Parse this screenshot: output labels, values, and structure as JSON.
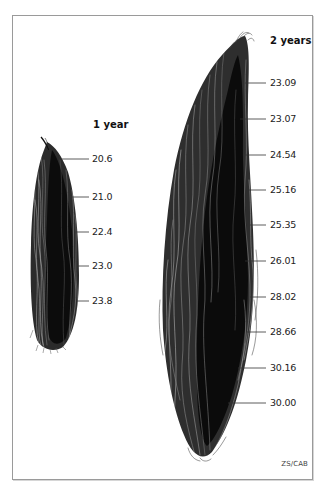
{
  "figure": {
    "credit": "ZS/CAB",
    "colors": {
      "fiber_dark": "#111111",
      "fiber_mid": "#3a3a3a",
      "fiber_light": "#8a8a8a",
      "leader_line": "#333333",
      "frame_border": "#9a9a9a",
      "background": "#ffffff"
    }
  },
  "samples": [
    {
      "id": "one-year",
      "label": "1 year",
      "label_pos": {
        "x": 93,
        "y": 125
      },
      "measurements": [
        {
          "value": "20.6",
          "y": 159,
          "line_x1": 62,
          "line_x2": 89
        },
        {
          "value": "21.0",
          "y": 197,
          "line_x1": 70,
          "line_x2": 89
        },
        {
          "value": "22.4",
          "y": 232,
          "line_x1": 75,
          "line_x2": 89
        },
        {
          "value": "23.0",
          "y": 266,
          "line_x1": 77,
          "line_x2": 89
        },
        {
          "value": "23.8",
          "y": 301,
          "line_x1": 76,
          "line_x2": 89
        }
      ]
    },
    {
      "id": "two-years",
      "label": "2 years",
      "label_pos": {
        "x": 270,
        "y": 41
      },
      "measurements": [
        {
          "value": "23.09",
          "y": 83,
          "line_x1": 245,
          "line_x2": 266
        },
        {
          "value": "23.07",
          "y": 119,
          "line_x1": 240,
          "line_x2": 266
        },
        {
          "value": "24.54",
          "y": 155,
          "line_x1": 243,
          "line_x2": 266
        },
        {
          "value": "25.16",
          "y": 190,
          "line_x1": 249,
          "line_x2": 266
        },
        {
          "value": "25.35",
          "y": 225,
          "line_x1": 250,
          "line_x2": 266
        },
        {
          "value": "26.01",
          "y": 261,
          "line_x1": 245,
          "line_x2": 266
        },
        {
          "value": "28.02",
          "y": 297,
          "line_x1": 250,
          "line_x2": 266
        },
        {
          "value": "28.66",
          "y": 332,
          "line_x1": 247,
          "line_x2": 266
        },
        {
          "value": "30.16",
          "y": 368,
          "line_x1": 238,
          "line_x2": 266
        },
        {
          "value": "30.00",
          "y": 403,
          "line_x1": 228,
          "line_x2": 266
        }
      ]
    }
  ]
}
